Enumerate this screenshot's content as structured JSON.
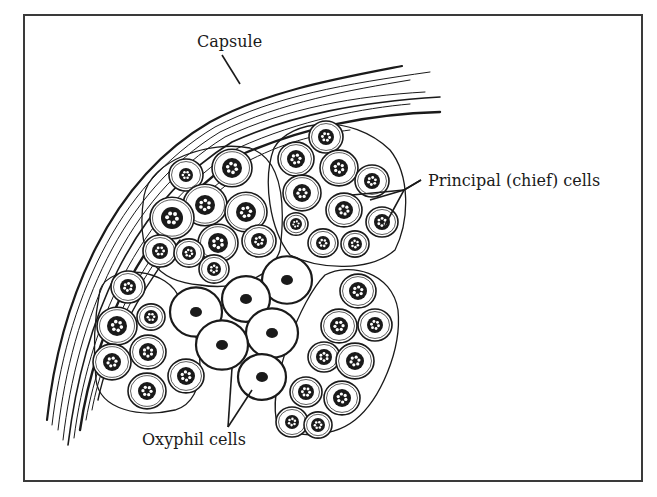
{
  "figure": {
    "border_color": "#3a3a3a",
    "ink_color": "#1a1a1a",
    "background": "#ffffff"
  },
  "labels": {
    "capsule": {
      "text": "Capsule",
      "x": 197,
      "y": 34
    },
    "principal": {
      "text": "Principal (chief) cells",
      "x": 428,
      "y": 173
    },
    "oxyphil": {
      "text": "Oxyphil cells",
      "x": 142,
      "y": 432
    }
  },
  "leaders": {
    "capsule": [
      [
        222,
        55
      ],
      [
        240,
        84
      ]
    ],
    "principal": [
      [
        [
          421,
          180
        ],
        [
          404,
          190
        ],
        [
          370,
          200
        ]
      ],
      [
        [
          421,
          180
        ],
        [
          404,
          190
        ],
        [
          385,
          225
        ]
      ],
      [
        [
          404,
          190
        ],
        [
          352,
          195
        ]
      ]
    ],
    "oxyphil": [
      [
        [
          228,
          427
        ],
        [
          232,
          368
        ]
      ],
      [
        [
          228,
          427
        ],
        [
          252,
          390
        ]
      ]
    ]
  },
  "principal_cells": [
    [
      186,
      175,
      17,
      7
    ],
    [
      232,
      168,
      20,
      10
    ],
    [
      205,
      205,
      22,
      10
    ],
    [
      246,
      212,
      21,
      10
    ],
    [
      172,
      218,
      22,
      11
    ],
    [
      218,
      243,
      20,
      10
    ],
    [
      259,
      241,
      17,
      8
    ],
    [
      160,
      251,
      17,
      8
    ],
    [
      189,
      253,
      15,
      7
    ],
    [
      214,
      269,
      15,
      7
    ],
    [
      296,
      159,
      18,
      9
    ],
    [
      326,
      137,
      17,
      8
    ],
    [
      339,
      168,
      19,
      9
    ],
    [
      372,
      181,
      17,
      8
    ],
    [
      302,
      193,
      19,
      9
    ],
    [
      344,
      210,
      18,
      9
    ],
    [
      382,
      222,
      16,
      8
    ],
    [
      296,
      224,
      12,
      6
    ],
    [
      323,
      243,
      15,
      7
    ],
    [
      355,
      244,
      14,
      7
    ],
    [
      128,
      287,
      17,
      8
    ],
    [
      151,
      317,
      14,
      7
    ],
    [
      117,
      326,
      20,
      10
    ],
    [
      148,
      352,
      18,
      9
    ],
    [
      112,
      362,
      19,
      9
    ],
    [
      147,
      391,
      19,
      9
    ],
    [
      186,
      376,
      18,
      9
    ],
    [
      358,
      291,
      18,
      9
    ],
    [
      339,
      326,
      18,
      9
    ],
    [
      375,
      325,
      17,
      8
    ],
    [
      324,
      357,
      16,
      8
    ],
    [
      355,
      361,
      19,
      9
    ],
    [
      306,
      392,
      16,
      8
    ],
    [
      342,
      398,
      18,
      9
    ],
    [
      292,
      422,
      16,
      7
    ],
    [
      318,
      425,
      14,
      7
    ]
  ],
  "oxyphil_cells": [
    [
      287,
      280,
      25,
      6
    ],
    [
      246,
      299,
      24,
      6
    ],
    [
      196,
      312,
      26,
      6
    ],
    [
      272,
      333,
      26,
      6
    ],
    [
      222,
      345,
      26,
      6
    ],
    [
      262,
      377,
      24,
      6
    ]
  ]
}
